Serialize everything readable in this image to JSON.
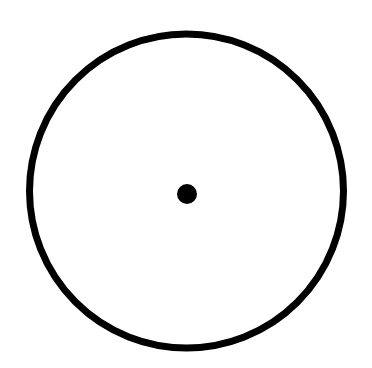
{
  "diagram": {
    "type": "circle-with-center-point",
    "background_color": "#ffffff",
    "circle": {
      "cx": 186.5,
      "cy": 191,
      "r": 157,
      "stroke_color": "#000000",
      "stroke_width": 7,
      "fill": "none"
    },
    "center_point": {
      "cx": 187,
      "cy": 194,
      "r": 10,
      "fill_color": "#000000"
    }
  }
}
